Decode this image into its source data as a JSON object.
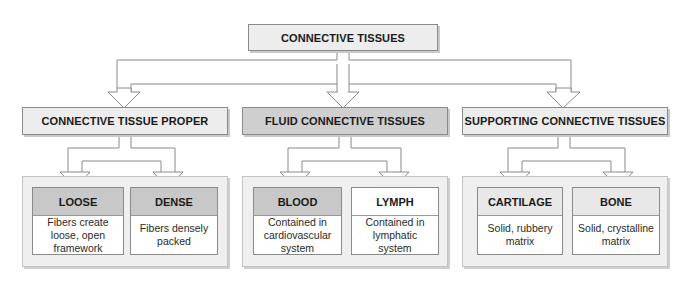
{
  "root": {
    "label": "CONNECTIVE TISSUES"
  },
  "categories": [
    {
      "label": "CONNECTIVE TISSUE PROPER",
      "children": [
        {
          "label": "LOOSE",
          "description": "Fibers create\nloose, open\nframework"
        },
        {
          "label": "DENSE",
          "description": "Fibers densely\npacked"
        }
      ]
    },
    {
      "label": "FLUID CONNECTIVE TISSUES",
      "children": [
        {
          "label": "BLOOD",
          "description": "Contained in\ncardiovascular\nsystem"
        },
        {
          "label": "LYMPH",
          "description": "Contained in\nlymphatic\nsystem"
        }
      ]
    },
    {
      "label": "SUPPORTING CONNECTIVE TISSUES",
      "children": [
        {
          "label": "CARTILAGE",
          "description": "Solid, rubbery\nmatrix"
        },
        {
          "label": "BONE",
          "description": "Solid, crystalline\nmatrix"
        }
      ]
    }
  ],
  "colors": {
    "box_light": "#ededed",
    "box_dark": "#cfcfcf",
    "border": "#8a8a8a"
  }
}
